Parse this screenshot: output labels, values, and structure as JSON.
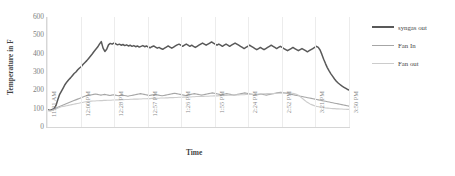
{
  "chart_data": {
    "type": "line",
    "title": "",
    "xlabel": "Time",
    "ylabel": "Temperature in F",
    "ylim": [
      0,
      600
    ],
    "yticks": [
      0,
      100,
      200,
      300,
      400,
      500,
      600
    ],
    "grid": "vertical",
    "legend_position": "right",
    "xtick_labels": [
      "11:31 AM",
      "12:00 PM",
      "12:28 PM",
      "12:57 PM",
      "1:26 PM",
      "1:55 PM",
      "2:24 PM",
      "2:52 PM",
      "3:21 PM",
      "3:50 PM"
    ],
    "colors": {
      "syngas_out": "#595959",
      "fan_in": "#a6a6a6",
      "fan_out": "#cccccc"
    },
    "series": [
      {
        "name": "syngas out",
        "color": "#595959",
        "values": [
          95,
          93,
          92,
          96,
          100,
          118,
          150,
          178,
          196,
          214,
          232,
          246,
          258,
          268,
          280,
          292,
          300,
          312,
          322,
          330,
          342,
          352,
          362,
          374,
          386,
          398,
          412,
          424,
          436,
          452,
          466,
          430,
          412,
          424,
          448,
          456,
          452,
          458,
          454,
          448,
          452,
          446,
          450,
          444,
          448,
          442,
          446,
          440,
          444,
          438,
          442,
          436,
          440,
          444,
          438,
          442,
          436,
          432,
          438,
          442,
          436,
          430,
          434,
          428,
          424,
          430,
          436,
          442,
          436,
          430,
          436,
          442,
          448,
          452,
          446,
          440,
          446,
          452,
          446,
          440,
          446,
          440,
          434,
          440,
          446,
          452,
          458,
          452,
          446,
          452,
          458,
          464,
          458,
          452,
          446,
          452,
          446,
          440,
          446,
          452,
          446,
          440,
          446,
          452,
          458,
          452,
          446,
          440,
          434,
          428,
          434,
          440,
          446,
          440,
          434,
          428,
          422,
          428,
          434,
          428,
          422,
          428,
          434,
          440,
          446,
          440,
          434,
          428,
          434,
          440,
          434,
          428,
          422,
          416,
          422,
          428,
          434,
          428,
          422,
          416,
          422,
          428,
          422,
          416,
          410,
          416,
          422,
          428,
          434,
          440,
          434,
          420,
          396,
          370,
          346,
          324,
          306,
          290,
          276,
          262,
          250,
          240,
          232,
          224,
          218,
          212,
          206,
          202
        ]
      },
      {
        "name": "Fan In",
        "color": "#a6a6a6",
        "values": [
          92,
          90,
          89,
          92,
          96,
          102,
          108,
          112,
          116,
          120,
          124,
          128,
          132,
          136,
          140,
          144,
          148,
          152,
          156,
          160,
          164,
          168,
          170,
          172,
          174,
          176,
          178,
          180,
          178,
          176,
          174,
          176,
          178,
          176,
          174,
          172,
          174,
          176,
          174,
          172,
          170,
          172,
          174,
          172,
          170,
          168,
          170,
          172,
          174,
          176,
          178,
          180,
          182,
          180,
          178,
          176,
          174,
          172,
          174,
          176,
          178,
          176,
          174,
          172,
          170,
          172,
          174,
          176,
          178,
          180,
          182,
          184,
          182,
          180,
          178,
          176,
          174,
          172,
          174,
          176,
          178,
          180,
          182,
          180,
          178,
          176,
          174,
          176,
          178,
          180,
          182,
          184,
          186,
          184,
          182,
          180,
          178,
          176,
          178,
          180,
          182,
          180,
          178,
          176,
          174,
          176,
          178,
          180,
          182,
          184,
          186,
          184,
          182,
          180,
          178,
          176,
          174,
          176,
          178,
          180,
          178,
          176,
          174,
          176,
          178,
          180,
          182,
          184,
          186,
          188,
          190,
          188,
          186,
          184,
          182,
          180,
          178,
          176,
          174,
          172,
          170,
          168,
          166,
          164,
          162,
          160,
          158,
          156,
          154,
          152,
          150,
          148,
          146,
          144,
          142,
          140,
          138,
          136,
          134,
          132,
          130,
          128,
          126,
          124,
          122,
          120,
          118,
          116,
          114
        ]
      },
      {
        "name": "Fan out",
        "color": "#cccccc",
        "values": [
          90,
          88,
          87,
          90,
          94,
          98,
          102,
          106,
          110,
          112,
          114,
          116,
          118,
          120,
          122,
          124,
          126,
          128,
          130,
          132,
          134,
          136,
          138,
          140,
          140,
          141,
          142,
          142,
          143,
          143,
          144,
          144,
          145,
          145,
          146,
          146,
          146,
          147,
          147,
          148,
          148,
          148,
          149,
          149,
          150,
          150,
          150,
          151,
          151,
          152,
          152,
          152,
          153,
          153,
          154,
          154,
          154,
          155,
          155,
          156,
          156,
          156,
          157,
          157,
          158,
          158,
          158,
          159,
          159,
          160,
          160,
          160,
          161,
          161,
          162,
          162,
          162,
          163,
          163,
          164,
          164,
          164,
          165,
          165,
          166,
          166,
          166,
          167,
          167,
          168,
          168,
          168,
          169,
          169,
          170,
          170,
          170,
          171,
          171,
          172,
          172,
          172,
          173,
          173,
          174,
          174,
          174,
          175,
          175,
          176,
          176,
          176,
          177,
          177,
          178,
          178,
          178,
          179,
          179,
          180,
          180,
          180,
          181,
          181,
          182,
          182,
          182,
          183,
          183,
          184,
          184,
          184,
          185,
          185,
          186,
          186,
          186,
          185,
          184,
          182,
          180,
          176,
          170,
          162,
          154,
          146,
          138,
          132,
          126,
          122,
          118,
          114,
          112,
          110,
          108,
          106,
          105,
          104,
          103,
          102,
          101,
          100,
          100,
          99,
          99,
          98,
          98,
          97,
          97,
          96,
          96
        ]
      }
    ]
  }
}
